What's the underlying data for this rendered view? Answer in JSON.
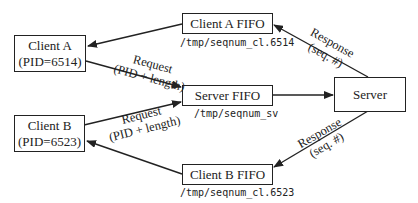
{
  "nodes": {
    "client_a": {
      "title": "Client A",
      "pid": "(PID=6514)"
    },
    "client_b": {
      "title": "Client B",
      "pid": "(PID=6523)"
    },
    "client_a_fifo": {
      "title": "Client A FIFO",
      "path": "/tmp/seqnum_cl.6514"
    },
    "server_fifo": {
      "title": "Server FIFO",
      "path": "/tmp/seqnum_sv"
    },
    "client_b_fifo": {
      "title": "Client B FIFO",
      "path": "/tmp/seqnum_cl.6523"
    },
    "server": {
      "title": "Server"
    }
  },
  "edges": {
    "request_a": {
      "line1": "Request",
      "line2": "(PID + length)"
    },
    "request_b": {
      "line1": "Request",
      "line2": "(PID + length)"
    },
    "response_a": {
      "line1": "Response",
      "line2": "(seq. #)"
    },
    "response_b": {
      "line1": "Response",
      "line2": "(seq. #)"
    }
  },
  "colors": {
    "stroke": "#222222",
    "background": "#ffffff"
  }
}
